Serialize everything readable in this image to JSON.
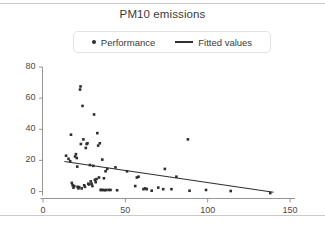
{
  "chart_data": {
    "type": "scatter",
    "title": "PM10 emissions",
    "xlabel": "",
    "ylabel": "",
    "xlim": [
      0,
      155
    ],
    "ylim": [
      -4,
      84
    ],
    "grid": false,
    "legend_position": "top-center",
    "xticks": [
      0,
      50,
      100,
      150
    ],
    "yticks": [
      0,
      20,
      40,
      60,
      80
    ],
    "legend": [
      {
        "label": "Performance",
        "marker": "dot",
        "color": "#2e2e2e"
      },
      {
        "label": "Fitted values",
        "marker": "line",
        "color": "#2e2e2e"
      }
    ],
    "series": [
      {
        "name": "Performance",
        "type": "scatter",
        "color": "#2e2e2e",
        "points": [
          [
            14.0,
            23.0
          ],
          [
            15.5,
            21.0
          ],
          [
            16.5,
            19.5
          ],
          [
            17.0,
            36.5
          ],
          [
            17.5,
            5.5
          ],
          [
            18.0,
            4.0
          ],
          [
            18.5,
            2.5
          ],
          [
            19.0,
            3.5
          ],
          [
            19.5,
            22.5
          ],
          [
            20.0,
            24.0
          ],
          [
            20.5,
            21.5
          ],
          [
            20.8,
            16.0
          ],
          [
            21.0,
            3.0
          ],
          [
            21.5,
            2.0
          ],
          [
            22.0,
            2.8
          ],
          [
            22.5,
            65.5
          ],
          [
            22.8,
            67.5
          ],
          [
            23.0,
            30.5
          ],
          [
            23.5,
            2.0
          ],
          [
            24.0,
            55.0
          ],
          [
            24.5,
            33.5
          ],
          [
            25.0,
            4.0
          ],
          [
            25.5,
            3.0
          ],
          [
            26.0,
            28.0
          ],
          [
            26.5,
            30.5
          ],
          [
            27.0,
            31.0
          ],
          [
            27.5,
            5.0
          ],
          [
            28.0,
            4.5
          ],
          [
            28.5,
            17.0
          ],
          [
            29.0,
            6.5
          ],
          [
            29.5,
            5.0
          ],
          [
            30.0,
            3.5
          ],
          [
            30.5,
            16.5
          ],
          [
            31.0,
            49.5
          ],
          [
            31.5,
            7.5
          ],
          [
            32.0,
            6.0
          ],
          [
            32.5,
            8.0
          ],
          [
            33.0,
            37.5
          ],
          [
            33.5,
            29.5
          ],
          [
            34.0,
            9.0
          ],
          [
            34.5,
            31.0
          ],
          [
            35.0,
            1.0
          ],
          [
            35.5,
            1.0
          ],
          [
            36.0,
            20.5
          ],
          [
            36.5,
            1.0
          ],
          [
            37.0,
            8.5
          ],
          [
            37.5,
            0.8
          ],
          [
            38.0,
            13.0
          ],
          [
            38.5,
            1.0
          ],
          [
            39.0,
            14.5
          ],
          [
            40.0,
            1.0
          ],
          [
            41.0,
            1.0
          ],
          [
            44.0,
            15.5
          ],
          [
            45.0,
            0.8
          ],
          [
            51.0,
            13.0
          ],
          [
            56.0,
            3.5
          ],
          [
            57.0,
            9.0
          ],
          [
            58.0,
            9.5
          ],
          [
            61.0,
            1.5
          ],
          [
            62.0,
            2.0
          ],
          [
            63.0,
            1.5
          ],
          [
            66.0,
            0.5
          ],
          [
            70.0,
            2.5
          ],
          [
            73.0,
            1.5
          ],
          [
            74.0,
            14.5
          ],
          [
            78.0,
            1.5
          ],
          [
            81.0,
            9.5
          ],
          [
            88.0,
            33.5
          ],
          [
            89.0,
            0.5
          ],
          [
            99.0,
            1.0
          ],
          [
            114.0,
            0.3
          ],
          [
            138.0,
            -1.0
          ]
        ]
      },
      {
        "name": "Fitted values",
        "type": "line",
        "color": "#2e2e2e",
        "points": [
          [
            13.0,
            19.3
          ],
          [
            140.0,
            -0.5
          ]
        ]
      }
    ]
  }
}
